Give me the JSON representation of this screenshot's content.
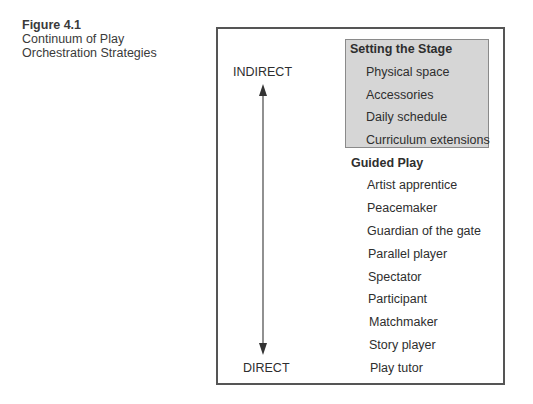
{
  "caption": {
    "figure_number": "Figure 4.1",
    "title_line1": "Continuum of Play",
    "title_line2": "Orchestration Strategies"
  },
  "axis": {
    "top_label": "INDIRECT",
    "bottom_label": "DIRECT"
  },
  "sections": [
    {
      "heading": "Setting the Stage",
      "shaded": true,
      "items": [
        "Physical space",
        "Accessories",
        "Daily schedule",
        "Curriculum extensions"
      ]
    },
    {
      "heading": "Guided Play",
      "shaded": false,
      "items": [
        "Artist apprentice",
        "Peacemaker",
        "Guardian of the gate",
        "Parallel player",
        "Spectator",
        "Participant",
        "Matchmaker",
        "Story player",
        "Play tutor"
      ]
    }
  ],
  "colors": {
    "shade": "#d6d6d6",
    "border": "#555555",
    "text": "#2e2e2e"
  }
}
